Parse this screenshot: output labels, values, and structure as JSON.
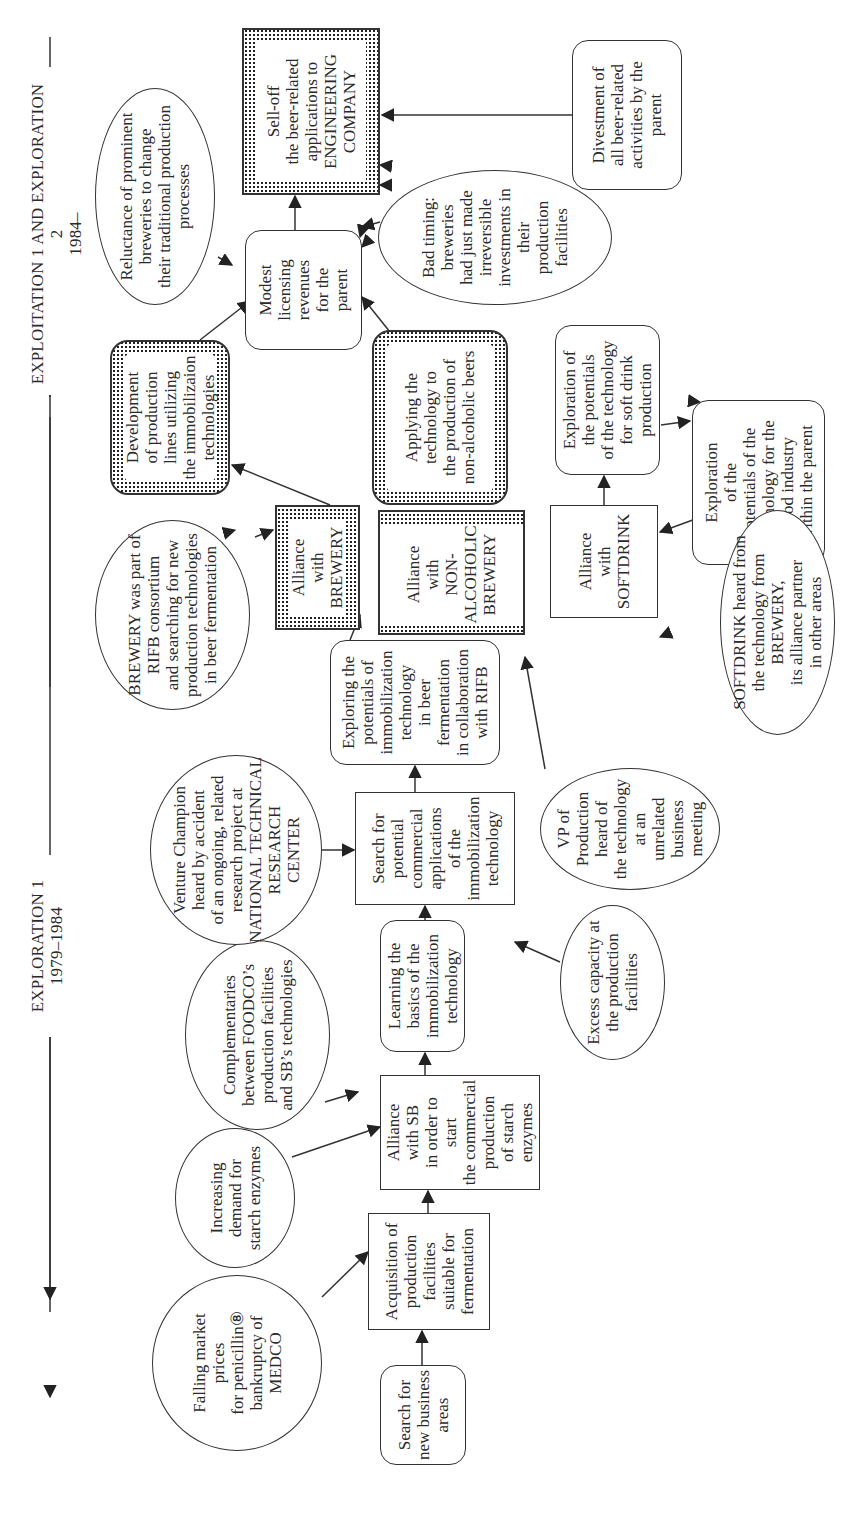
{
  "phases": {
    "phase1": {
      "title": "EXPLORATION 1",
      "years": "1979–1984"
    },
    "phase2": {
      "title": "EXPLOITATION 1 AND EXPLORATION 2",
      "years": "1984–"
    }
  },
  "nodes": {
    "search_new_business": "Search for\nnew business\nareas",
    "acquisition": "Acquisition of\nproduction\nfacilities\nsuitable for\nfermentation",
    "alliance_sb": "Alliance\nwith SB\nin order to\nstart\nthe commercial\nproduction\nof starch\nenzymes",
    "learning_basics": "Learning the\nbasics of the\nimmobilization\ntechnology",
    "search_potential": "Search for\npotential\ncommercial\napplications\nof the\nimmobilization\ntechnology",
    "exploring_rifb": "Exploring  the\npotentials of\nimmobilization\ntechnology\nin beer\nfermentation\nin collaboration\nwith RIFB",
    "alliance_brewery": "Alliance\nwith\nBREWERY",
    "alliance_nonalc": "Alliance\nwith\nNON-\nALCOHOLIC\nBREWERY",
    "alliance_softdrink": "Alliance\nwith\nSOFTDRINK",
    "development_lines": "Development\nof  production\nlines utilizing\nthe immobilizaion\ntechnologies",
    "applying_nonalc": "Applying the\ntechnology to\nthe production of\nnon-alcoholic beers",
    "exploration_softdrink": "Exploration of\nthe potentials\nof  the technology\nfor soft drink\nproduction",
    "exploration_food": "Exploration\nof the\npotentials of  the\ntechnology for the\nfood industry\nwithin the parent",
    "modest_licensing": "Modest\nlicensing\nrevenues\nfor the\nparent",
    "selloff": "Sell-off\nthe beer-related\napplications to\nENGINEERING\nCOMPANY",
    "divestment": "Divestment of\nall beer-related\nactivities by the\nparent"
  },
  "factors": {
    "falling_prices": "Falling market\nprices\nfor penicillin⑧\nbankruptcy of\nMEDCO",
    "increasing_demand": "Increasing\ndemand for\nstarch enzymes",
    "complementaries": "Complementaries\nbetween FOODCO’s\nproduction facilities\nand SB’s technologies",
    "venture_champion": "Venture Champion\nheard by accident\nof an ongoing, related\nresearch project at\nNATIONAL TECHNICAL\nRESEARCH\nCENTER",
    "brewery_rifb": "BREWERY was part of\nRIFB consortium\nand searching for new\nproduction technologies\nin beer fermentation",
    "excess_capacity": "Excess capacity at\nthe production\nfacilities",
    "vp_production": "VP of\nProduction\nheard of\nthe technology\nat an\nunrelated\nbusiness\nmeeting",
    "softdrink_heard": "SOFTDRINK heard from\nthe technology from BREWERY,\nits alliance partner\nin other areas",
    "reluctance": "Reluctance of prominent\nbreweries to change\ntheir traditional production\nprocesses",
    "bad_timing": "Bad timing:\nbreweries\nhad just made\nirreversible\ninvestments in\ntheir\nproduction\nfacilities"
  },
  "colors": {
    "line": "#333333",
    "background": "#ffffff",
    "text": "#2a2a2a"
  }
}
